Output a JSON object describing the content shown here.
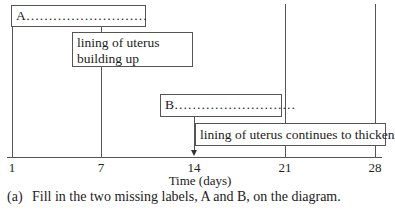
{
  "diagram": {
    "boxes": {
      "A": {
        "label": "A………………………",
        "type": "blank-label"
      },
      "lining_building": {
        "line1": "lining of uterus",
        "line2": "building up"
      },
      "B": {
        "label": "B………………………",
        "type": "blank-label"
      },
      "lining_thicken": {
        "label": "lining of uterus continues to thicken"
      }
    },
    "axis": {
      "ticks": [
        "1",
        "7",
        "14",
        "21",
        "28"
      ],
      "title": "Time (days)"
    }
  },
  "question": {
    "number": "(a)",
    "text": "Fill in the two missing labels, A and B, on the diagram."
  }
}
